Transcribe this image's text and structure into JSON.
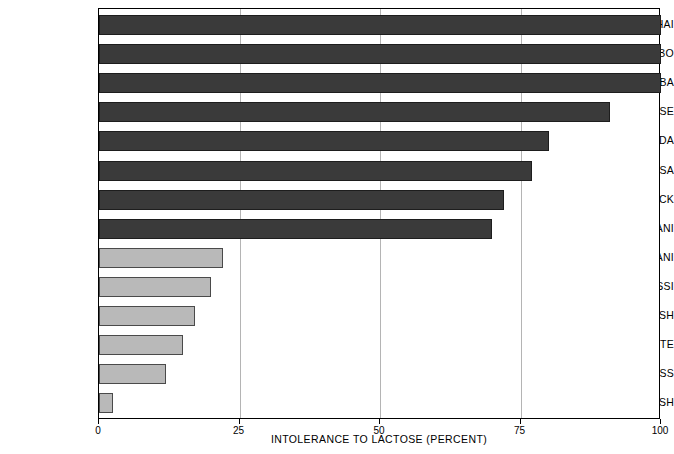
{
  "chart_data": {
    "type": "bar",
    "orientation": "horizontal",
    "title": "",
    "xlabel": "INTOLERANCE TO LACTOSE (PERCENT)",
    "ylabel": "",
    "xlim": [
      0,
      100
    ],
    "xticks": [
      0,
      25,
      50,
      75,
      100
    ],
    "xtick_labels": [
      "0",
      "25",
      "50",
      "75",
      "100"
    ],
    "grid": "vertical",
    "legend": "none",
    "categories": [
      "THAI",
      "IBO",
      "YORUBA",
      "CHINESE",
      "GANDA",
      "HAUSA",
      "U.S. BLACK",
      "HAUSA-FULANI",
      "FULANI",
      "TUSSI",
      "FINNISH",
      "U.S. WHITE",
      "SWISS",
      "SWEDISH"
    ],
    "values": [
      100,
      100,
      100,
      91,
      80,
      77,
      72,
      70,
      22,
      20,
      17,
      15,
      12,
      2.5
    ],
    "bar_groups": [
      {
        "name": "high-intolerance",
        "color": "#3a3a3a",
        "categories": [
          "THAI",
          "IBO",
          "YORUBA",
          "CHINESE",
          "GANDA",
          "HAUSA",
          "U.S. BLACK",
          "HAUSA-FULANI"
        ]
      },
      {
        "name": "low-intolerance",
        "color": "#b9b9b9",
        "categories": [
          "FULANI",
          "TUSSI",
          "FINNISH",
          "U.S. WHITE",
          "SWISS",
          "SWEDISH"
        ]
      }
    ],
    "bars": [
      {
        "label": "THAI",
        "value": 100,
        "style": "dark"
      },
      {
        "label": "IBO",
        "value": 100,
        "style": "dark"
      },
      {
        "label": "YORUBA",
        "value": 100,
        "style": "dark"
      },
      {
        "label": "CHINESE",
        "value": 91,
        "style": "dark"
      },
      {
        "label": "GANDA",
        "value": 80,
        "style": "dark"
      },
      {
        "label": "HAUSA",
        "value": 77,
        "style": "dark"
      },
      {
        "label": "U.S. BLACK",
        "value": 72,
        "style": "dark"
      },
      {
        "label": "HAUSA-FULANI",
        "value": 70,
        "style": "dark"
      },
      {
        "label": "FULANI",
        "value": 22,
        "style": "light"
      },
      {
        "label": "TUSSI",
        "value": 20,
        "style": "light"
      },
      {
        "label": "FINNISH",
        "value": 17,
        "style": "light"
      },
      {
        "label": "U.S. WHITE",
        "value": 15,
        "style": "light"
      },
      {
        "label": "SWISS",
        "value": 12,
        "style": "light"
      },
      {
        "label": "SWEDISH",
        "value": 2.5,
        "style": "light"
      }
    ],
    "colors": {
      "bar_dark": "#3a3a3a",
      "bar_dark_border": "#1d1d1d",
      "bar_light": "#b9b9b9",
      "bar_light_border": "#4a4a4a",
      "gridline": "#b4b4b4",
      "axis": "#000000",
      "background": "#ffffff"
    }
  }
}
